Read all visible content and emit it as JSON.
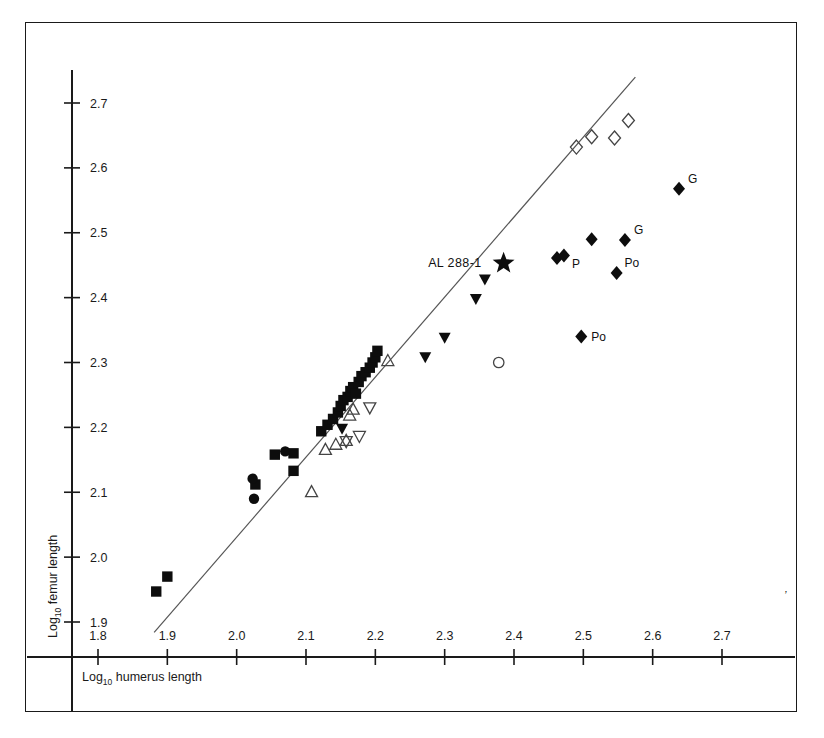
{
  "figure": {
    "background_color": "#ffffff",
    "marker_color": "#0d0d0d",
    "open_marker_stroke": "#444444",
    "line_color": "#555555",
    "corner_mark": "’"
  },
  "axes": {
    "x": {
      "label_prefix": "Log",
      "label_sub": "10",
      "label_suffix": " humerus length",
      "label_full": "Log10 humerus length",
      "ticks": [
        "1.8",
        "1.9",
        "2.0",
        "2.1",
        "2.2",
        "2.3",
        "2.4",
        "2.5",
        "2.6",
        "2.7"
      ],
      "tick_values": [
        1.8,
        1.9,
        2.0,
        2.1,
        2.2,
        2.3,
        2.4,
        2.5,
        2.6,
        2.7
      ],
      "min": 1.8,
      "max": 2.7
    },
    "y": {
      "label_prefix": "Log",
      "label_sub": "10",
      "label_suffix": " femur length",
      "label_full": "Log10 femur length",
      "ticks": [
        "1.9",
        "2.0",
        "2.1",
        "2.2",
        "2.3",
        "2.4",
        "2.5",
        "2.6",
        "2.7"
      ],
      "tick_values": [
        1.9,
        2.0,
        2.1,
        2.2,
        2.3,
        2.4,
        2.5,
        2.6,
        2.7
      ],
      "min": 1.9,
      "max": 2.7
    }
  },
  "chart_data": {
    "type": "scatter",
    "title": "",
    "xlabel": "Log10 humerus length",
    "ylabel": "Log10 femur length",
    "xlim": [
      1.8,
      2.7
    ],
    "ylim": [
      1.9,
      2.7
    ],
    "grid": false,
    "legend_position": "none",
    "regression_line": {
      "name": "reference line",
      "x1": 1.881,
      "y1": 1.884,
      "x2": 2.575,
      "y2": 2.74
    },
    "series": [
      {
        "name": "filled-square",
        "marker": "square-filled",
        "points": [
          [
            1.884,
            1.947
          ],
          [
            1.9,
            1.97
          ],
          [
            2.027,
            2.112
          ],
          [
            2.055,
            2.158
          ],
          [
            2.082,
            2.16
          ],
          [
            2.082,
            2.133
          ],
          [
            2.122,
            2.194
          ],
          [
            2.131,
            2.204
          ],
          [
            2.139,
            2.213
          ],
          [
            2.146,
            2.223
          ],
          [
            2.15,
            2.233
          ],
          [
            2.154,
            2.242
          ],
          [
            2.16,
            2.247
          ],
          [
            2.164,
            2.256
          ],
          [
            2.168,
            2.262
          ],
          [
            2.172,
            2.252
          ],
          [
            2.176,
            2.27
          ],
          [
            2.18,
            2.279
          ],
          [
            2.186,
            2.285
          ],
          [
            2.192,
            2.292
          ],
          [
            2.196,
            2.3
          ],
          [
            2.2,
            2.308
          ],
          [
            2.203,
            2.318
          ]
        ]
      },
      {
        "name": "filled-circle",
        "marker": "circle-filled",
        "points": [
          [
            2.023,
            2.121
          ],
          [
            2.025,
            2.09
          ],
          [
            2.07,
            2.163
          ]
        ]
      },
      {
        "name": "open-triangle-up",
        "marker": "triangle-up-open",
        "points": [
          [
            2.108,
            2.101
          ],
          [
            2.128,
            2.166
          ],
          [
            2.143,
            2.174
          ],
          [
            2.158,
            2.18
          ],
          [
            2.163,
            2.219
          ],
          [
            2.168,
            2.228
          ],
          [
            2.218,
            2.303
          ]
        ]
      },
      {
        "name": "open-triangle-down",
        "marker": "triangle-down-open",
        "points": [
          [
            2.158,
            2.178
          ],
          [
            2.177,
            2.186
          ],
          [
            2.192,
            2.23
          ]
        ]
      },
      {
        "name": "filled-triangle-down",
        "marker": "triangle-down-filled",
        "points": [
          [
            2.152,
            2.198
          ],
          [
            2.272,
            2.308
          ],
          [
            2.3,
            2.338
          ],
          [
            2.345,
            2.398
          ],
          [
            2.358,
            2.428
          ]
        ]
      },
      {
        "name": "open-circle",
        "marker": "circle-open",
        "points": [
          [
            2.378,
            2.3
          ]
        ]
      },
      {
        "name": "open-diamond",
        "marker": "diamond-open",
        "points": [
          [
            2.49,
            2.632
          ],
          [
            2.512,
            2.648
          ],
          [
            2.545,
            2.646
          ],
          [
            2.565,
            2.673
          ]
        ]
      },
      {
        "name": "filled-diamond",
        "marker": "diamond-filled",
        "points": [
          [
            2.462,
            2.461
          ],
          [
            2.472,
            2.465
          ],
          [
            2.497,
            2.34
          ],
          [
            2.512,
            2.49
          ],
          [
            2.548,
            2.438
          ],
          [
            2.56,
            2.489
          ],
          [
            2.638,
            2.568
          ]
        ]
      },
      {
        "name": "star-specimen",
        "marker": "star-filled",
        "points": [
          [
            2.385,
            2.453
          ]
        ]
      }
    ],
    "annotations": [
      {
        "text": "AL 288-1",
        "x": 2.385,
        "y": 2.453,
        "anchor": "end",
        "dx": -22,
        "dy": 4
      },
      {
        "text": "G",
        "x": 2.638,
        "y": 2.568,
        "anchor": "start",
        "dx": 9,
        "dy": -6
      },
      {
        "text": "G",
        "x": 2.56,
        "y": 2.489,
        "anchor": "start",
        "dx": 9,
        "dy": -6
      },
      {
        "text": "P",
        "x": 2.472,
        "y": 2.465,
        "anchor": "start",
        "dx": 8,
        "dy": 13
      },
      {
        "text": "Po",
        "x": 2.548,
        "y": 2.438,
        "anchor": "start",
        "dx": 8,
        "dy": -6
      },
      {
        "text": "Po",
        "x": 2.497,
        "y": 2.34,
        "anchor": "start",
        "dx": 10,
        "dy": 4
      }
    ]
  }
}
